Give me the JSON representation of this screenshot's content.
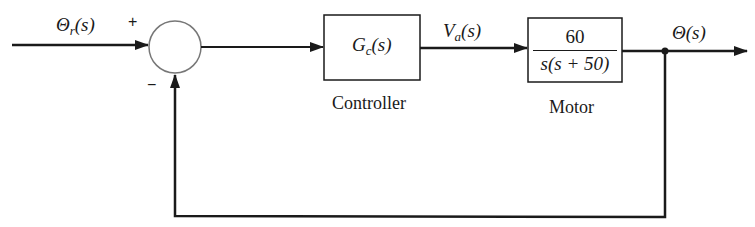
{
  "diagram": {
    "type": "block-diagram",
    "signals": {
      "input": {
        "symbol": "Θ",
        "subscript": "r",
        "arg": "(s)"
      },
      "control_voltage": {
        "symbol": "V",
        "subscript": "a",
        "arg": "(s)"
      },
      "output": {
        "symbol": "Θ",
        "arg": "(s)"
      }
    },
    "summing_junction": {
      "plus_sign": "+",
      "minus_sign": "−"
    },
    "blocks": {
      "controller": {
        "tf_symbol": "G",
        "tf_subscript": "c",
        "tf_arg": "(s)",
        "label": "Controller"
      },
      "motor": {
        "numerator": "60",
        "denominator": "s(s + 50)",
        "label": "Motor"
      }
    },
    "feedback": {
      "type": "unity",
      "sign": "negative"
    },
    "colors": {
      "line": "#1a1a1a",
      "circle": "#777777",
      "background": "#ffffff"
    }
  }
}
